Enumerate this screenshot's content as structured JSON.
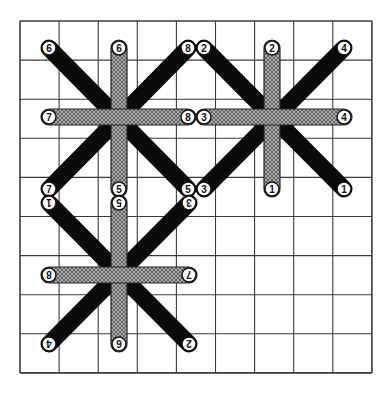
{
  "diagram": {
    "colors": {
      "background": "#ffffff",
      "grid": "#3a3a3a",
      "dark_stitch": "#0a0a0a",
      "hatched_fill": "#9a9a9a",
      "hatched_line": "#4a4a4a",
      "node_fill": "#ffffff",
      "node_stroke": "#111111"
    },
    "grid": {
      "x0": 20,
      "y0": 21,
      "cols": 9,
      "rows": 9,
      "cell": 39.1
    },
    "stars": [
      {
        "name": "star-top-left",
        "xs": [
          49,
          119,
          188
        ],
        "ys": [
          48,
          117,
          189
        ],
        "rotated_labels": false,
        "labels": {
          "top_left": "6",
          "top_middle": "6",
          "top_right": "8",
          "middle_left": "7",
          "middle_right": "8",
          "bottom_left": "7",
          "bottom_middle": "5",
          "bottom_right": "5"
        }
      },
      {
        "name": "star-top-right",
        "xs": [
          204,
          272,
          344
        ],
        "ys": [
          48,
          117,
          189
        ],
        "rotated_labels": false,
        "labels": {
          "top_left": "2",
          "top_middle": "2",
          "top_right": "4",
          "middle_left": "3",
          "middle_right": "4",
          "bottom_left": "3",
          "bottom_middle": "1",
          "bottom_right": "1"
        }
      },
      {
        "name": "star-bottom-left",
        "xs": [
          49,
          119,
          189
        ],
        "ys": [
          203,
          275,
          344
        ],
        "rotated_labels": true,
        "labels": {
          "top_left": "1",
          "top_middle": "5",
          "top_right": "3",
          "middle_left": "8",
          "middle_right": "7",
          "bottom_left": "4",
          "bottom_middle": "6",
          "bottom_right": "2"
        }
      }
    ]
  }
}
